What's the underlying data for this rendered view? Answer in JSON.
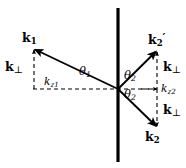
{
  "figure": {
    "kind": "vector-scattering-diagram",
    "background_color": "#ffffff",
    "stroke_color": "#000000",
    "interface_line": {
      "name": "vertical-interface-line",
      "x": 118,
      "y_top": 8,
      "y_bottom": 162,
      "width_px": 3.2
    },
    "origin": {
      "x": 118,
      "y": 89
    },
    "axis": {
      "name": "horizontal-dashed-axis",
      "x_start": 33,
      "x_end": 158,
      "y": 89,
      "dash": "4,3"
    },
    "vectors": [
      {
        "id": "k1",
        "label": "k",
        "sub": "1",
        "prime": "",
        "from": {
          "x": 118,
          "y": 89
        },
        "to": {
          "x": 34,
          "y": 49
        },
        "arrow": true
      },
      {
        "id": "k2prime",
        "label": "k",
        "sub": "2",
        "prime": "′",
        "from": {
          "x": 118,
          "y": 89
        },
        "to": {
          "x": 157,
          "y": 51
        },
        "arrow": true
      },
      {
        "id": "k2",
        "label": "k",
        "sub": "2",
        "prime": "",
        "from": {
          "x": 118,
          "y": 89
        },
        "to": {
          "x": 157,
          "y": 127
        },
        "arrow": true
      }
    ],
    "dashed_components": [
      {
        "id": "kperp-left",
        "x1": 34,
        "y1": 50,
        "x2": 34,
        "y2": 89,
        "arrow_at": "start"
      },
      {
        "id": "kperp-upper-right",
        "x1": 157,
        "y1": 52,
        "x2": 157,
        "y2": 89,
        "arrow_at": "start"
      },
      {
        "id": "kperp-lower-right",
        "x1": 157,
        "y1": 89,
        "x2": 157,
        "y2": 126,
        "arrow_at": "end"
      },
      {
        "id": "kz2-tick",
        "x1": 140,
        "y1": 89,
        "x2": 157,
        "y2": 89,
        "arrow_at": "end"
      }
    ],
    "labels": {
      "k1": {
        "base": "k",
        "subscript": "1"
      },
      "k2_prime": {
        "base": "k",
        "subscript": "2",
        "prime": "′"
      },
      "k2": {
        "base": "k",
        "subscript": "2"
      },
      "k_perp_left": {
        "base": "k",
        "subscript": "⊥"
      },
      "k_perp_upper_right": {
        "base": "k",
        "subscript": "⊥"
      },
      "k_perp_lower_right": {
        "base": "k",
        "subscript": "⊥"
      },
      "k_z1": {
        "base": "k",
        "subscript": "z1"
      },
      "k_z2": {
        "base": "k",
        "subscript": "z2"
      },
      "theta_1": {
        "base": "θ",
        "subscript": "1"
      },
      "theta_2_upper": {
        "base": "θ",
        "subscript": "2"
      },
      "theta_2_lower": {
        "base": "θ",
        "subscript": "2"
      }
    }
  }
}
